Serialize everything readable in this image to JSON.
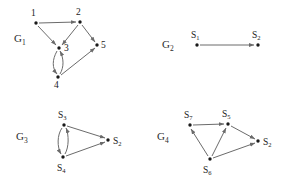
{
  "figure": {
    "width": 284,
    "height": 175,
    "background": "#ffffff",
    "edge_color": "#6b6b6b",
    "vertex_color": "#1a1a1a",
    "label_color": "#222222"
  },
  "panels": {
    "g1": {
      "label_base": "G",
      "label_sub": "1",
      "label_x": 14,
      "label_y": 42,
      "nodes": [
        {
          "name": "node-1",
          "base": "1",
          "sub": "",
          "x": 36,
          "y": 23,
          "lx": 31,
          "ly": 16
        },
        {
          "name": "node-2",
          "base": "2",
          "sub": "",
          "x": 80,
          "y": 22,
          "lx": 76,
          "ly": 15
        },
        {
          "name": "node-3",
          "base": "3",
          "sub": "",
          "x": 59,
          "y": 48,
          "lx": 64,
          "ly": 50
        },
        {
          "name": "node-4",
          "base": "4",
          "sub": "",
          "x": 58,
          "y": 77,
          "lx": 54,
          "ly": 87
        },
        {
          "name": "node-5",
          "base": "5",
          "sub": "",
          "x": 97,
          "y": 45,
          "lx": 101,
          "ly": 48
        }
      ],
      "edges": [
        {
          "name": "edge-1-2",
          "from": "1",
          "to": "2",
          "kind": "straight"
        },
        {
          "name": "edge-1-3",
          "from": "1",
          "to": "3",
          "kind": "straight"
        },
        {
          "name": "edge-2-3",
          "from": "2",
          "to": "3",
          "kind": "straight"
        },
        {
          "name": "edge-2-5",
          "from": "2",
          "to": "5",
          "kind": "straight"
        },
        {
          "name": "edge-3-4-down",
          "from": "3",
          "to": "4",
          "kind": "curved"
        },
        {
          "name": "edge-4-3-up",
          "from": "4",
          "to": "3",
          "kind": "curved"
        },
        {
          "name": "edge-4-5",
          "from": "4",
          "to": "5",
          "kind": "straight"
        }
      ]
    },
    "g2": {
      "label_base": "G",
      "label_sub": "2",
      "label_x": 162,
      "label_y": 48,
      "nodes": [
        {
          "name": "node-s1",
          "base": "S",
          "sub": "1",
          "x": 197,
          "y": 45,
          "lx": 191,
          "ly": 37
        },
        {
          "name": "node-s2",
          "base": "S",
          "sub": "2",
          "x": 258,
          "y": 45,
          "lx": 252,
          "ly": 37
        }
      ],
      "edges": [
        {
          "name": "edge-s1-s2",
          "from": "S1",
          "to": "S2",
          "kind": "straight"
        }
      ]
    },
    "g3": {
      "label_base": "G",
      "label_sub": "3",
      "label_x": 16,
      "label_y": 140,
      "nodes": [
        {
          "name": "node-s3",
          "base": "S",
          "sub": "3",
          "x": 64,
          "y": 125,
          "lx": 58,
          "ly": 117
        },
        {
          "name": "node-s2",
          "base": "S",
          "sub": "2",
          "x": 108,
          "y": 140,
          "lx": 113,
          "ly": 143
        },
        {
          "name": "node-s4",
          "base": "S",
          "sub": "4",
          "x": 63,
          "y": 157,
          "lx": 57,
          "ly": 170
        }
      ],
      "edges": [
        {
          "name": "edge-s3-s2",
          "from": "S3",
          "to": "S2",
          "kind": "straight"
        },
        {
          "name": "edge-s4-s2",
          "from": "S4",
          "to": "S2",
          "kind": "straight"
        },
        {
          "name": "edge-s3-s4-down",
          "from": "S3",
          "to": "S4",
          "kind": "curved"
        },
        {
          "name": "edge-s4-s3-up",
          "from": "S4",
          "to": "S3",
          "kind": "curved"
        }
      ]
    },
    "g4": {
      "label_base": "G",
      "label_sub": "4",
      "label_x": 157,
      "label_y": 140,
      "nodes": [
        {
          "name": "node-s7",
          "base": "S",
          "sub": "7",
          "x": 190,
          "y": 125,
          "lx": 184,
          "ly": 117
        },
        {
          "name": "node-s5",
          "base": "S",
          "sub": "5",
          "x": 228,
          "y": 124,
          "lx": 222,
          "ly": 116
        },
        {
          "name": "node-s2",
          "base": "S",
          "sub": "2",
          "x": 258,
          "y": 141,
          "lx": 263,
          "ly": 144
        },
        {
          "name": "node-s6",
          "base": "S",
          "sub": "6",
          "x": 210,
          "y": 159,
          "lx": 203,
          "ly": 172
        }
      ],
      "edges": [
        {
          "name": "edge-s7-s5",
          "from": "S7",
          "to": "S5",
          "kind": "straight"
        },
        {
          "name": "edge-s6-s7",
          "from": "S6",
          "to": "S7",
          "kind": "straight"
        },
        {
          "name": "edge-s6-s5",
          "from": "S6",
          "to": "S5",
          "kind": "straight"
        },
        {
          "name": "edge-s5-s2",
          "from": "S5",
          "to": "S2",
          "kind": "straight"
        },
        {
          "name": "edge-s6-s2",
          "from": "S6",
          "to": "S2",
          "kind": "straight"
        }
      ]
    }
  }
}
